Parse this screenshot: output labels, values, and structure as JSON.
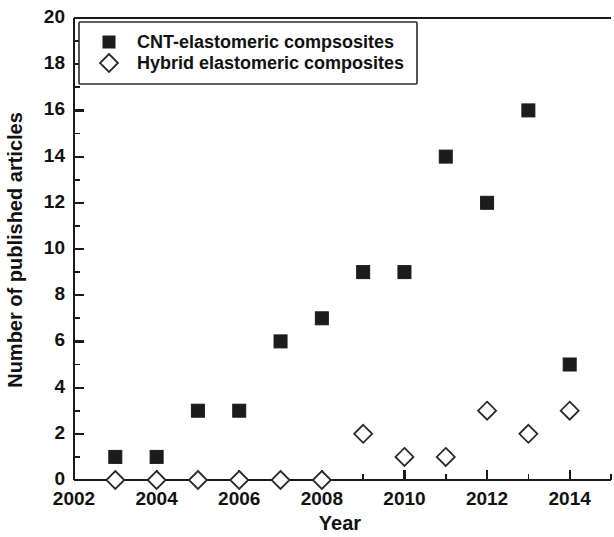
{
  "chart_data": {
    "type": "scatter",
    "title": "",
    "xlabel": "Year",
    "ylabel": "Number of published articles",
    "xlim": [
      2002,
      2015
    ],
    "ylim": [
      0,
      20
    ],
    "xticks": [
      2002,
      2004,
      2006,
      2008,
      2010,
      2012,
      2014
    ],
    "xtick_labels": [
      "2002",
      "2004",
      "2006",
      "2008",
      "2010",
      "2012",
      "2014"
    ],
    "x_minor_ticks": [
      2003,
      2005,
      2007,
      2009,
      2011,
      2013,
      2015
    ],
    "yticks": [
      0,
      2,
      4,
      6,
      8,
      10,
      12,
      14,
      16,
      18,
      20
    ],
    "ytick_labels": [
      "0",
      "2",
      "4",
      "6",
      "8",
      "10",
      "12",
      "14",
      "16",
      "18",
      "20"
    ],
    "y_minor_ticks": [
      1,
      3,
      5,
      7,
      9,
      11,
      13,
      15,
      17,
      19
    ],
    "grid": false,
    "legend_position": "top-left",
    "x": [
      2003,
      2004,
      2005,
      2006,
      2007,
      2008,
      2009,
      2010,
      2011,
      2012,
      2013,
      2014
    ],
    "series": [
      {
        "name": "CNT-elastomeric compsosites",
        "marker": "filled-square",
        "color": "#1c1c1c",
        "values": [
          1,
          1,
          3,
          3,
          6,
          7,
          9,
          9,
          14,
          12,
          16,
          5
        ]
      },
      {
        "name": "Hybrid elastomeric composites",
        "marker": "open-diamond",
        "color": "#2a2a2a",
        "values": [
          0,
          0,
          0,
          0,
          0,
          0,
          2,
          1,
          1,
          3,
          2,
          3
        ]
      }
    ]
  },
  "legend": {
    "entries": [
      {
        "label": "CNT-elastomeric compsosites",
        "marker": "filled-square"
      },
      {
        "label": "Hybrid elastomeric composites",
        "marker": "open-diamond"
      }
    ]
  },
  "colors": {
    "foreground": "#111111",
    "axis": "#1a1a1a",
    "background": "#ffffff",
    "series_1": "#1c1c1c",
    "series_2": "#2a2a2a"
  }
}
